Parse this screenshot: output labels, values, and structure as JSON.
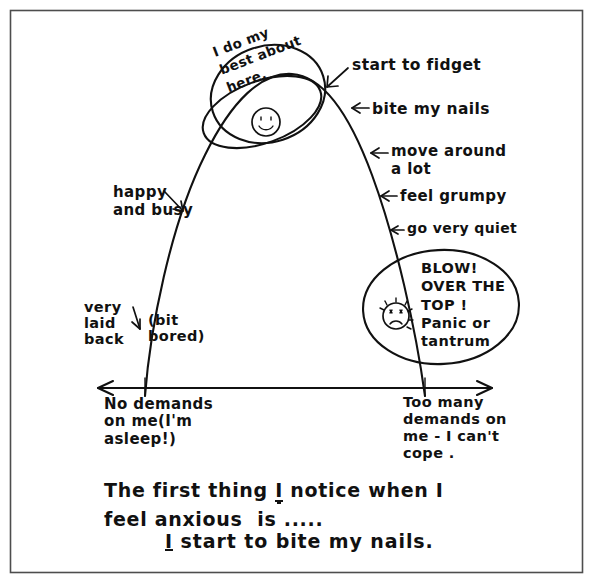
{
  "page": {
    "background_color": "#ffffff",
    "ink_color": "#111111",
    "frame_color": "#4d4d4d"
  },
  "diagram": {
    "curve_label": "inverted-u-arousal-curve",
    "peak_ellipse": {
      "text_line1": "I do my",
      "text_line2": "best about",
      "text_line3": "here.",
      "face_icon": "smiley-face-icon"
    },
    "blow_ellipse": {
      "text_line1": "BLOW!",
      "text_line2": "OVER THE",
      "text_line3": "TOP !",
      "text_line4": "Panic or",
      "text_line5": "tantrum",
      "face_icon": "exploding-distressed-face-icon"
    },
    "right_labels": [
      "start to fidget",
      "bite my nails",
      "move around\na lot",
      "feel grumpy",
      "go very quiet"
    ],
    "left_labels": {
      "happy_busy_line1": "happy",
      "happy_busy_line2": "and busy",
      "laid_back_line1": "very",
      "laid_back_line2": "laid",
      "laid_back_line3": "back",
      "bored_line1": "(bit",
      "bored_line2": "bored)"
    },
    "axis": {
      "type": "double-headed-horizontal-arrow",
      "left_label_line1": "No demands",
      "left_label_line2": "on me(I'm",
      "left_label_line3": "asleep!)",
      "right_label_line1": "Too many",
      "right_label_line2": "demands on",
      "right_label_line3": "me - I can't",
      "right_label_line4": "cope ."
    }
  },
  "prompt": {
    "line1_part1": "The first thing ",
    "line1_emphasis": "I",
    "line1_part2": " notice when I",
    "line2": "feel anxious  is .....",
    "answer_emphasis": "I",
    "answer_rest": " start to bite my nails."
  }
}
